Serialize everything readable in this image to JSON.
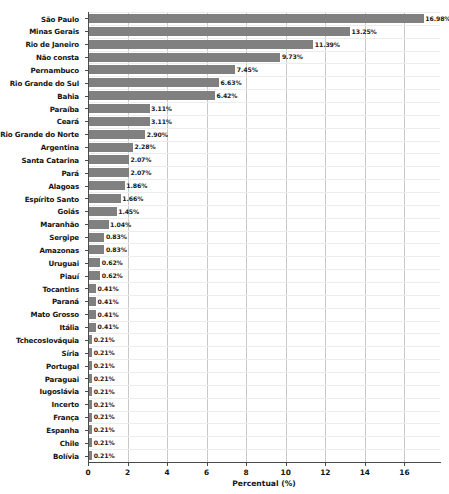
{
  "chart_data": {
    "type": "bar",
    "orientation": "horizontal",
    "title": "",
    "xlabel": "Percentual (%)",
    "ylabel": "",
    "xlim": [
      0,
      17.8
    ],
    "xticks": [
      0,
      2,
      4,
      6,
      8,
      10,
      12,
      14,
      16
    ],
    "xtick_labels": [
      "0",
      "2",
      "4",
      "6",
      "8",
      "10",
      "12",
      "14",
      "16"
    ],
    "grid": "vertical-and-horizontal",
    "legend": "none",
    "bar_color": "#808080",
    "value_label_suffix": "%",
    "categories": [
      "Bolívia",
      "Chile",
      "Espanha",
      "França",
      "Incerto",
      "Iugoslávia",
      "Paraguai",
      "Portugal",
      "Síria",
      "Tchecoslováquia",
      "Itália",
      "Mato Grosso",
      "Paraná",
      "Tocantins",
      "Piauí",
      "Uruguai",
      "Amazonas",
      "Sergipe",
      "Maranhão",
      "Goiás",
      "Espírito Santo",
      "Alagoas",
      "Pará",
      "Santa Catarina",
      "Argentina",
      "Rio Grande do Norte",
      "Ceará",
      "Paraíba",
      "Bahia",
      "Rio Grande do Sul",
      "Pernambuco",
      "Não consta",
      "Rio de Janeiro",
      "Minas Gerais",
      "São Paulo"
    ],
    "values": [
      0.21,
      0.21,
      0.21,
      0.21,
      0.21,
      0.21,
      0.21,
      0.21,
      0.21,
      0.21,
      0.41,
      0.41,
      0.41,
      0.41,
      0.62,
      0.62,
      0.83,
      0.83,
      1.04,
      1.45,
      1.66,
      1.86,
      2.07,
      2.07,
      2.28,
      2.9,
      3.11,
      3.11,
      6.42,
      6.63,
      7.45,
      9.73,
      11.39,
      13.25,
      16.98
    ],
    "value_labels": [
      "0.21%",
      "0.21%",
      "0.21%",
      "0.21%",
      "0.21%",
      "0.21%",
      "0.21%",
      "0.21%",
      "0.21%",
      "0.21%",
      "0.41%",
      "0.41%",
      "0.41%",
      "0.41%",
      "0.62%",
      "0.62%",
      "0.83%",
      "0.83%",
      "1.04%",
      "1.45%",
      "1.66%",
      "1.86%",
      "2.07%",
      "2.07%",
      "2.28%",
      "2.90%",
      "3.11%",
      "3.11%",
      "6.42%",
      "6.63%",
      "7.45%",
      "9.73%",
      "11.39%",
      "13.25%",
      "16.98%"
    ]
  }
}
